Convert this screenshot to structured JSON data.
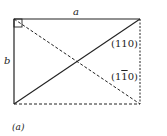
{
  "diagram": {
    "labels": {
      "a": "a",
      "b": "b",
      "plane_110": "(110)",
      "plane_1bar10_prefix": "(1",
      "plane_1bar10_bar": "1",
      "plane_1bar10_suffix": "0)",
      "panel": "(a)"
    },
    "colors": {
      "line": "#222222",
      "background": "#ffffff"
    }
  }
}
